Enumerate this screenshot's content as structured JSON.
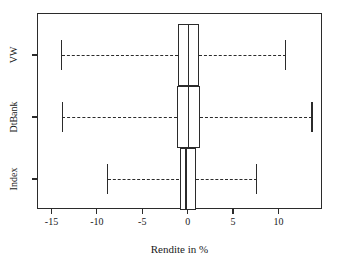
{
  "chart_data": {
    "type": "box",
    "title": "",
    "xlabel": "Rendite in %",
    "ylabel": "",
    "grid": false,
    "legend": "none",
    "xlim": [
      -16.6,
      14.8
    ],
    "xticks": [
      -15,
      -10,
      -5,
      0,
      5,
      10
    ],
    "xtick_labels": [
      "-15",
      "-10",
      "-5",
      "0",
      "5",
      "10"
    ],
    "categories": [
      "VW",
      "DtBank",
      "Index"
    ],
    "orientation": "horizontal",
    "boxes": [
      {
        "name": "VW",
        "whisker_low": -13.9,
        "q1": -1.1,
        "median": 0.1,
        "q3": 1.2,
        "whisker_high": 10.8
      },
      {
        "name": "DtBank",
        "whisker_low": -13.8,
        "q1": -1.2,
        "median": 0.1,
        "q3": 1.4,
        "whisker_high": 13.7
      },
      {
        "name": "Index",
        "whisker_low": -8.8,
        "q1": -0.9,
        "median": -0.2,
        "q3": 0.9,
        "whisker_high": 7.6
      }
    ]
  },
  "axes": {
    "x_title": "Rendite in %",
    "x_tick_labels": [
      "-15",
      "-10",
      "-5",
      "0",
      "5",
      "10"
    ],
    "y_tick_labels": [
      "VW",
      "DtBank",
      "Index"
    ]
  },
  "style": {
    "frame_color": "#2b2b2b",
    "box_fill": "#ffffff",
    "line_color": "#2b2b2b",
    "background": "#ffffff"
  }
}
